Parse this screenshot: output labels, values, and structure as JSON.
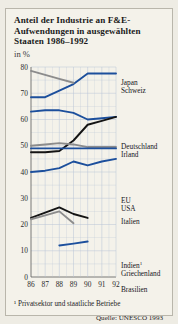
{
  "title": "Anteil der Industrie an F&E-Aufwendungen in ausgewählten Staaten 1986–1992",
  "subtitle": "in %",
  "footnote": "¹ Privatsektor und staatliche Betriebe",
  "source": "Quelle: UNESCO 1993",
  "colors": {
    "blue": "#1c4f9c",
    "black": "#141414",
    "gray": "#8c8c8c",
    "grid": "#b9c4d6",
    "axis": "#5a5a5a",
    "card": "#f4f2ea",
    "page": "#eeece4"
  },
  "chart_data": {
    "type": "line",
    "title": "Anteil der Industrie an F&E-Aufwendungen in ausgewählten Staaten 1986–1992",
    "xlabel": "",
    "ylabel": "in %",
    "ylim": [
      0,
      80
    ],
    "xlim": [
      86,
      92
    ],
    "grid": true,
    "legend": "right",
    "yticks": [
      0,
      10,
      20,
      30,
      40,
      50,
      60,
      70,
      80
    ],
    "xticks": [
      "86",
      "87",
      "88",
      "89",
      "90",
      "91",
      "92"
    ],
    "x": [
      86,
      87,
      88,
      89,
      90,
      91,
      92
    ],
    "series": [
      {
        "name": "Japan",
        "color": "blue",
        "label_group": "top",
        "values": [
          68.5,
          68.5,
          71.0,
          73.5,
          77.5,
          77.5,
          77.5
        ]
      },
      {
        "name": "Schweiz",
        "color": "gray",
        "label_group": "top",
        "values": [
          78.5,
          77.0,
          75.5,
          74.0,
          null,
          null,
          null
        ]
      },
      {
        "name": "Deutschland",
        "color": "blue",
        "label_group": "mid",
        "values": [
          63.0,
          63.5,
          63.5,
          62.5,
          60.0,
          60.5,
          61.0
        ]
      },
      {
        "name": "Irland",
        "color": "black",
        "label_group": "mid",
        "values": [
          47.5,
          47.5,
          48.0,
          52.0,
          58.0,
          59.5,
          61.0
        ]
      },
      {
        "name": "EU",
        "color": "gray",
        "label_group": "mideu",
        "values": [
          50.0,
          50.5,
          51.0,
          50.5,
          49.5,
          49.5,
          49.5
        ]
      },
      {
        "name": "USA",
        "color": "blue",
        "label_group": "mideu",
        "values": [
          49.0,
          49.0,
          49.0,
          49.0,
          49.0,
          49.0,
          49.0
        ]
      },
      {
        "name": "Italien",
        "color": "blue",
        "label_group": "italien",
        "values": [
          40.0,
          40.5,
          41.5,
          44.0,
          42.5,
          44.0,
          45.0
        ]
      },
      {
        "name": "Indien",
        "color": "black",
        "label_group": "low",
        "values": [
          22.5,
          24.5,
          26.5,
          24.0,
          22.5,
          null,
          null
        ]
      },
      {
        "name": "Griechenland",
        "color": "gray",
        "label_group": "low",
        "values": [
          22.0,
          23.5,
          25.0,
          20.5,
          null,
          null,
          null
        ]
      },
      {
        "name": "Brasilien",
        "color": "blue",
        "label_group": "bras",
        "values": [
          null,
          null,
          12.0,
          12.7,
          13.5,
          null,
          null
        ]
      }
    ]
  },
  "legend_labels": {
    "japan": "Japan",
    "schweiz": "Schweiz",
    "deutschland": "Deutschland",
    "irland": "Irland",
    "eu": "EU",
    "usa": "USA",
    "italien": "Italien",
    "indien": "Indien",
    "indien_sup": "1",
    "griechenland": "Griechenland",
    "brasilien": "Brasilien"
  }
}
